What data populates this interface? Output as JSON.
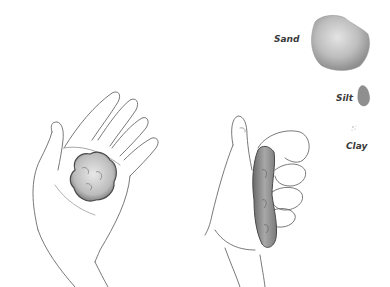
{
  "illustration": {
    "particles": [
      {
        "label": "Sand",
        "size": "large",
        "color": "#a8a8a8"
      },
      {
        "label": "Silt",
        "size": "small",
        "color": "#8f8f8f"
      },
      {
        "label": "Clay",
        "size": "tiny",
        "color": "#b0b0b0"
      }
    ],
    "scenes": [
      {
        "name": "open-hand-with-soil-ball"
      },
      {
        "name": "hand-squeezing-soil-ribbon"
      }
    ],
    "colors": {
      "line": "#6a6a6a",
      "soil": "#9a9a9a",
      "soil_dark": "#5a5a5a",
      "background": "#ffffff"
    }
  }
}
